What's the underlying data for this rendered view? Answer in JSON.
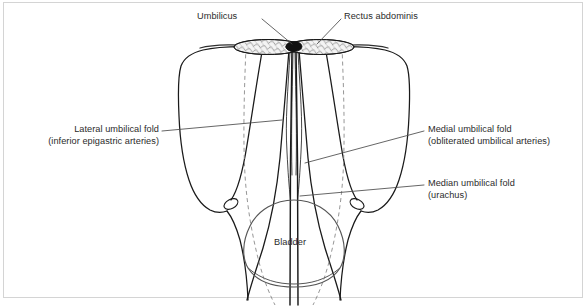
{
  "figure": {
    "title_visible": false,
    "background_color": "#ffffff",
    "frame_color": "#d4d4d4",
    "ink_color": "#1a1a1a",
    "text_color": "#2b2b2b"
  },
  "labels": {
    "umbilicus": {
      "line1": "Umbilicus"
    },
    "rectus_abdominis": {
      "line1": "Rectus abdominis"
    },
    "lateral_umbilical_fold": {
      "line1": "Lateral umbilical fold",
      "line2": "(inferior epigastric arteries)"
    },
    "medial_umbilical_fold": {
      "line1": "Medial umbilical fold",
      "line2": "(obliterated umbilical arteries)"
    },
    "median_umbilical_fold": {
      "line1": "Median umbilical fold",
      "line2": "(urachus)"
    },
    "bladder": {
      "line1": "Bladder"
    }
  },
  "anatomy_parts": [
    "Umbilicus",
    "Rectus abdominis",
    "Lateral umbilical fold",
    "Medial umbilical fold",
    "Median umbilical fold",
    "Bladder"
  ]
}
